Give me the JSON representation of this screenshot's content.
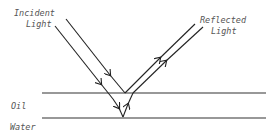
{
  "diagram": {
    "labels": {
      "incident_line1": "Incident",
      "incident_line2": "Light",
      "reflected_line1": "Reflected",
      "reflected_line2": "Light",
      "oil": "Oil",
      "water": "Water"
    },
    "colors": {
      "line": "#222222",
      "text": "#555555",
      "background": "#ffffff"
    }
  }
}
